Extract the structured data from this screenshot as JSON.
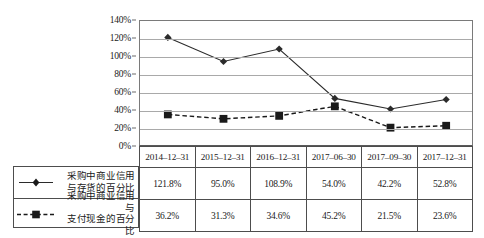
{
  "chart_data": {
    "type": "line",
    "title": "",
    "xlabel": "",
    "ylabel": "",
    "ylim": [
      0,
      140
    ],
    "ytick_step": 20,
    "grid": true,
    "legend_position": "bottom-left-table",
    "categories": [
      "2014-12-31",
      "2015-12-31",
      "2016-12-31",
      "2017-06-30",
      "2017-09-30",
      "2017-12-31"
    ],
    "series": [
      {
        "name": "采购中商业信用与存货的百分比",
        "name_line1": "采购中商业信用",
        "name_line2": "与存货的百分比",
        "marker": "diamond",
        "linestyle": "solid",
        "color": "#2b2b2b",
        "values": [
          121.8,
          95.0,
          108.9,
          54.0,
          42.2,
          52.8
        ],
        "labels": [
          "121.8%",
          "95.0%",
          "108.9%",
          "54.0%",
          "42.2%",
          "52.8%"
        ]
      },
      {
        "name": "采购中商业信用与支付现金的百分比",
        "name_line1": "采购中商业信用与",
        "name_line2": "支付现金的百分比",
        "marker": "square",
        "linestyle": "dashed",
        "color": "#1a1a1a",
        "values": [
          36.2,
          31.3,
          34.6,
          45.2,
          21.5,
          23.6
        ],
        "labels": [
          "36.2%",
          "31.3%",
          "34.6%",
          "45.2%",
          "21.5%",
          "23.6%"
        ]
      }
    ],
    "ytick_labels": [
      "0%",
      "20%",
      "40%",
      "60%",
      "80%",
      "100%",
      "120%",
      "140%"
    ],
    "ytick_values": [
      0,
      20,
      40,
      60,
      80,
      100,
      120,
      140
    ]
  }
}
